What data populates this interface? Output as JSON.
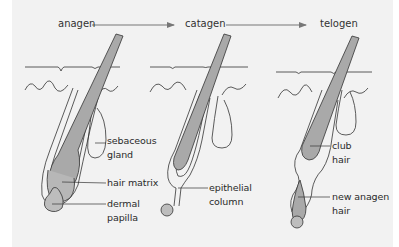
{
  "stages": [
    {
      "label": "anagen"
    },
    {
      "label": "catagen"
    },
    {
      "label": "telogen"
    }
  ],
  "labels": {
    "anagen": [
      {
        "line1": "sebaceous",
        "line2": "gland"
      },
      {
        "line1": "hair matrix"
      },
      {
        "line1": "dermal",
        "line2": "papilla"
      }
    ],
    "catagen": [
      {
        "line1": "epithelial",
        "line2": "column"
      }
    ],
    "telogen": [
      {
        "line1": "club",
        "line2": "hair"
      },
      {
        "line1": "new anagen",
        "line2": "hair"
      }
    ]
  },
  "colors": {
    "background": "#f2f2f2",
    "hair_fill": "#a9a9a9",
    "stroke": "#333333",
    "arrow": "#777777"
  }
}
